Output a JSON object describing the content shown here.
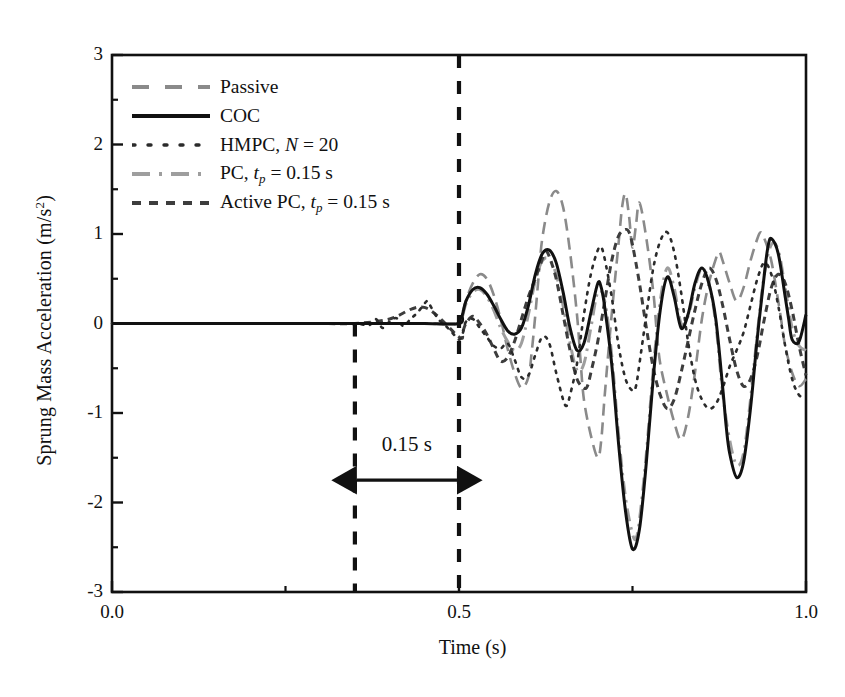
{
  "chart_data": {
    "type": "line",
    "title": "",
    "xlabel": "Time (s)",
    "ylabel": "Sprung Mass Acceleration (m/s",
    "ylabel_sup": "2",
    "ylabel_tail": ")",
    "xlim": [
      0.0,
      1.0
    ],
    "ylim": [
      -3,
      3
    ],
    "grid": false,
    "legend_position": "upper-left",
    "xticks_major": [
      0.0,
      0.5,
      1.0
    ],
    "xtick_labels": [
      "0.0",
      "0.5",
      "1.0"
    ],
    "xticks_minor": [
      0.25,
      0.75
    ],
    "yticks_major": [
      3,
      2,
      1,
      0,
      -1,
      -2,
      -3
    ],
    "ytick_labels": [
      "3",
      "2",
      "1",
      "0",
      "-1",
      "-2",
      "-3"
    ],
    "yticks_minor": [
      2.5,
      1.5,
      0.5,
      -0.5,
      -1.5,
      -2.5
    ],
    "annotations": [
      {
        "name": "delay-span",
        "text": "0.15 s",
        "x_from": 0.35,
        "x_to": 0.5,
        "y": -1.75,
        "label_y": -1.42
      },
      {
        "name": "vline-start",
        "x": 0.35,
        "style": "dashed",
        "y_from": 0.0,
        "y_to": -3.0
      },
      {
        "name": "vline-event",
        "x": 0.5,
        "style": "dashed",
        "y_from": 3.0,
        "y_to": -3.0
      }
    ],
    "series": [
      {
        "name": "Passive",
        "label": "Passive",
        "color": "#8a8a8a",
        "style": "dashed",
        "width": 2.6,
        "x": [
          0.0,
          0.05,
          0.1,
          0.15,
          0.2,
          0.25,
          0.3,
          0.35,
          0.4,
          0.45,
          0.5,
          0.505,
          0.512,
          0.52,
          0.53,
          0.54,
          0.55,
          0.56,
          0.57,
          0.58,
          0.59,
          0.6,
          0.605,
          0.61,
          0.615,
          0.62,
          0.63,
          0.64,
          0.65,
          0.66,
          0.67,
          0.675,
          0.68,
          0.69,
          0.7,
          0.705,
          0.71,
          0.72,
          0.73,
          0.735,
          0.74,
          0.745,
          0.75,
          0.755,
          0.76,
          0.77,
          0.78,
          0.785,
          0.79,
          0.8,
          0.81,
          0.82,
          0.83,
          0.84,
          0.85,
          0.86,
          0.87,
          0.875,
          0.88,
          0.89,
          0.9,
          0.91,
          0.92,
          0.93,
          0.935,
          0.94,
          0.95,
          0.96,
          0.965,
          0.97,
          0.98,
          0.99,
          1.0
        ],
        "y": [
          0,
          0,
          0,
          0,
          0,
          0,
          0,
          0,
          0,
          0,
          0,
          0.12,
          0.3,
          0.45,
          0.55,
          0.5,
          0.32,
          0.05,
          -0.28,
          -0.55,
          -0.72,
          -0.6,
          -0.3,
          0.1,
          0.55,
          0.95,
          1.35,
          1.48,
          1.3,
          0.8,
          0.1,
          -0.4,
          -0.85,
          -1.25,
          -1.5,
          -1.3,
          -0.8,
          0.1,
          0.9,
          1.3,
          1.45,
          1.2,
          0.85,
          1.1,
          1.35,
          0.95,
          0.35,
          -0.1,
          -0.45,
          -0.8,
          -1.1,
          -1.3,
          -1.05,
          -0.55,
          0.05,
          0.45,
          0.72,
          0.8,
          0.7,
          0.45,
          0.25,
          0.4,
          0.7,
          0.95,
          1.02,
          0.95,
          0.7,
          0.25,
          0.0,
          -0.25,
          -0.55,
          -0.7,
          -0.62
        ]
      },
      {
        "name": "COC",
        "label": "COC",
        "color": "#111111",
        "style": "solid",
        "width": 3.0,
        "x": [
          0.0,
          0.1,
          0.2,
          0.3,
          0.35,
          0.4,
          0.45,
          0.5,
          0.505,
          0.51,
          0.52,
          0.53,
          0.54,
          0.55,
          0.56,
          0.57,
          0.58,
          0.59,
          0.6,
          0.61,
          0.62,
          0.63,
          0.64,
          0.65,
          0.66,
          0.67,
          0.68,
          0.69,
          0.7,
          0.705,
          0.71,
          0.72,
          0.73,
          0.74,
          0.75,
          0.76,
          0.77,
          0.78,
          0.79,
          0.8,
          0.81,
          0.82,
          0.83,
          0.84,
          0.85,
          0.86,
          0.87,
          0.88,
          0.885,
          0.89,
          0.9,
          0.91,
          0.92,
          0.93,
          0.94,
          0.945,
          0.95,
          0.96,
          0.97,
          0.975,
          0.98,
          0.99,
          1.0
        ],
        "y": [
          0,
          0,
          0,
          0,
          0,
          0,
          0,
          0,
          0.1,
          0.25,
          0.38,
          0.4,
          0.33,
          0.2,
          0.05,
          -0.08,
          -0.12,
          -0.05,
          0.2,
          0.55,
          0.78,
          0.82,
          0.68,
          0.35,
          -0.05,
          -0.3,
          -0.22,
          0.12,
          0.45,
          0.4,
          0.18,
          -0.45,
          -1.35,
          -2.1,
          -2.52,
          -2.3,
          -1.55,
          -0.6,
          0.15,
          0.52,
          0.3,
          -0.05,
          0.1,
          0.45,
          0.62,
          0.45,
          0.05,
          -0.72,
          -1.15,
          -1.45,
          -1.72,
          -1.55,
          -0.95,
          -0.15,
          0.55,
          0.85,
          0.95,
          0.78,
          0.3,
          0.05,
          -0.18,
          -0.2,
          0.1
        ]
      },
      {
        "name": "HMPC",
        "label": "HMPC, N = 20",
        "label_prefix": "HMPC, ",
        "label_italic": "N",
        "label_suffix": " = 20",
        "color": "#2b2b2b",
        "style": "dotted",
        "width": 2.6,
        "x": [
          0.0,
          0.1,
          0.2,
          0.3,
          0.35,
          0.37,
          0.38,
          0.39,
          0.4,
          0.41,
          0.42,
          0.43,
          0.44,
          0.45,
          0.455,
          0.46,
          0.47,
          0.48,
          0.49,
          0.5,
          0.505,
          0.51,
          0.52,
          0.53,
          0.54,
          0.55,
          0.56,
          0.57,
          0.58,
          0.59,
          0.6,
          0.61,
          0.62,
          0.63,
          0.64,
          0.65,
          0.655,
          0.66,
          0.67,
          0.68,
          0.69,
          0.7,
          0.705,
          0.71,
          0.72,
          0.73,
          0.74,
          0.75,
          0.755,
          0.76,
          0.77,
          0.78,
          0.79,
          0.8,
          0.81,
          0.82,
          0.83,
          0.84,
          0.85,
          0.86,
          0.87,
          0.88,
          0.89,
          0.9,
          0.91,
          0.92,
          0.93,
          0.94,
          0.95,
          0.96,
          0.97,
          0.98,
          0.99,
          1.0
        ],
        "y": [
          0,
          0,
          0,
          0,
          0,
          -0.02,
          0.05,
          -0.05,
          0.02,
          0.06,
          -0.03,
          0.05,
          0.12,
          0.22,
          0.25,
          0.18,
          0.05,
          -0.02,
          -0.1,
          -0.18,
          -0.12,
          0.02,
          0.05,
          -0.05,
          -0.15,
          -0.25,
          -0.28,
          -0.22,
          -0.4,
          -0.6,
          -0.58,
          -0.35,
          -0.15,
          -0.22,
          -0.55,
          -0.85,
          -0.92,
          -0.8,
          -0.45,
          0.1,
          0.55,
          0.82,
          0.85,
          0.72,
          0.3,
          -0.25,
          -0.62,
          -0.75,
          -0.7,
          -0.45,
          0.1,
          0.62,
          0.92,
          1.02,
          0.8,
          0.35,
          -0.2,
          -0.62,
          -0.85,
          -0.95,
          -0.9,
          -0.72,
          -0.48,
          -0.3,
          -0.1,
          0.2,
          0.5,
          0.68,
          0.55,
          0.2,
          -0.25,
          -0.62,
          -0.8,
          -0.82
        ]
      },
      {
        "name": "PC",
        "label": "PC, tp = 0.15 s",
        "label_prefix": "PC, ",
        "label_italic": "t",
        "label_sub": "p",
        "label_suffix": " = 0.15 s",
        "color": "#9e9e9e",
        "style": "dashdot",
        "width": 3.0,
        "x": [
          0.0,
          0.1,
          0.2,
          0.3,
          0.35,
          0.4,
          0.45,
          0.5,
          0.505,
          0.51,
          0.52,
          0.53,
          0.54,
          0.55,
          0.56,
          0.57,
          0.58,
          0.59,
          0.6,
          0.61,
          0.62,
          0.63,
          0.64,
          0.65,
          0.66,
          0.67,
          0.68,
          0.69,
          0.7,
          0.71,
          0.72,
          0.73,
          0.74,
          0.75,
          0.755,
          0.76,
          0.77,
          0.78,
          0.79,
          0.8,
          0.81,
          0.82,
          0.83,
          0.84,
          0.85,
          0.86,
          0.87,
          0.88,
          0.89,
          0.9,
          0.91,
          0.92,
          0.93,
          0.94,
          0.95,
          0.96,
          0.97,
          0.98,
          0.99,
          1.0
        ],
        "y": [
          0,
          0,
          0,
          0,
          0,
          0,
          0,
          0,
          0.08,
          0.22,
          0.35,
          0.38,
          0.3,
          0.15,
          -0.05,
          -0.2,
          -0.3,
          -0.22,
          0.1,
          0.48,
          0.7,
          0.72,
          0.55,
          0.2,
          -0.22,
          -0.52,
          -0.45,
          -0.05,
          0.35,
          0.25,
          -0.35,
          -1.25,
          -1.95,
          -2.35,
          -2.4,
          -2.2,
          -1.45,
          -0.5,
          0.25,
          0.62,
          0.4,
          0.0,
          0.08,
          0.4,
          0.62,
          0.45,
          0.0,
          -0.78,
          -1.3,
          -1.58,
          -1.45,
          -0.85,
          -0.1,
          0.55,
          0.88,
          0.82,
          0.4,
          -0.05,
          -0.25,
          -0.3
        ]
      },
      {
        "name": "ActivePC",
        "label": "Active PC, tp = 0.15 s",
        "label_prefix": "Active PC, ",
        "label_italic": "t",
        "label_sub": "p",
        "label_suffix": " = 0.15 s",
        "color": "#3d3d3d",
        "style": "densedash",
        "width": 3.0,
        "x": [
          0.0,
          0.1,
          0.2,
          0.3,
          0.35,
          0.4,
          0.45,
          0.5,
          0.505,
          0.51,
          0.52,
          0.53,
          0.54,
          0.55,
          0.56,
          0.57,
          0.58,
          0.59,
          0.6,
          0.61,
          0.62,
          0.625,
          0.63,
          0.64,
          0.65,
          0.66,
          0.67,
          0.68,
          0.685,
          0.69,
          0.7,
          0.71,
          0.72,
          0.73,
          0.74,
          0.745,
          0.75,
          0.76,
          0.77,
          0.78,
          0.79,
          0.8,
          0.81,
          0.82,
          0.83,
          0.84,
          0.85,
          0.86,
          0.87,
          0.88,
          0.89,
          0.9,
          0.91,
          0.92,
          0.93,
          0.94,
          0.95,
          0.96,
          0.97,
          0.98,
          0.99,
          1.0
        ],
        "y": [
          0,
          0,
          0,
          0,
          0,
          0.05,
          0.18,
          -0.15,
          -0.1,
          0.0,
          0.08,
          0.0,
          -0.12,
          -0.28,
          -0.42,
          -0.38,
          -0.2,
          0.05,
          0.3,
          0.5,
          0.72,
          0.8,
          0.75,
          0.5,
          0.1,
          -0.3,
          -0.62,
          -0.72,
          -0.7,
          -0.55,
          -0.2,
          0.25,
          0.7,
          0.98,
          1.05,
          1.02,
          0.88,
          0.45,
          -0.05,
          -0.5,
          -0.8,
          -0.95,
          -0.85,
          -0.55,
          -0.2,
          0.15,
          0.45,
          0.62,
          0.5,
          0.2,
          -0.18,
          -0.52,
          -0.7,
          -0.62,
          -0.35,
          0.05,
          0.4,
          0.55,
          0.45,
          0.15,
          -0.25,
          -0.58
        ]
      }
    ]
  },
  "legend": {
    "items": [
      {
        "label": "Passive",
        "key": "dashed-gray"
      },
      {
        "label": "COC",
        "key": "solid-black"
      },
      {
        "label": "HMPC, N = 20",
        "key": "dotted-dark"
      },
      {
        "label": "PC, tp = 0.15 s",
        "key": "dashdot-gray"
      },
      {
        "label": "Active PC, tp = 0.15 s",
        "key": "densedash-dark"
      }
    ]
  },
  "annotation": {
    "delay_label": "0.15 s"
  }
}
